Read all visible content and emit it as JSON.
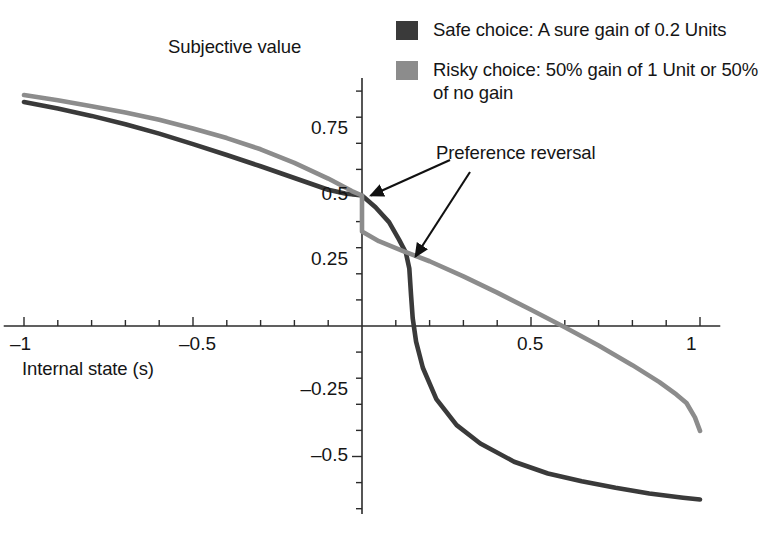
{
  "chart_data": {
    "type": "line",
    "title": "",
    "xlabel": "Internal state (s)",
    "ylabel": "Subjective value",
    "xlim": [
      -1.06,
      1.06
    ],
    "ylim": [
      -0.72,
      0.95
    ],
    "grid": false,
    "legend_position": "top-right",
    "xticks": [
      -1,
      -0.5,
      0.5,
      1
    ],
    "xtick_labels": [
      "–1",
      "–0.5",
      "0.5",
      "1"
    ],
    "yticks": [
      0.75,
      0.5,
      0.25,
      -0.25,
      -0.5
    ],
    "ytick_labels": [
      "0.75",
      "0.5",
      "0.25",
      "–0.25",
      "–0.5"
    ],
    "minor_tick_step": 0.1,
    "annotations": [
      {
        "text": "Preference reversal",
        "targets": [
          {
            "x": 0.0,
            "y": 0.5
          },
          {
            "x": 0.135,
            "y": 0.275
          }
        ]
      }
    ],
    "series": [
      {
        "name": "Safe choice: A sure gain of 0.2 Units",
        "color": "#3a3a3a",
        "x": [
          -1.0,
          -0.9,
          -0.8,
          -0.7,
          -0.6,
          -0.5,
          -0.4,
          -0.3,
          -0.2,
          -0.1,
          -0.05,
          0.0,
          0.04,
          0.08,
          0.11,
          0.13,
          0.14,
          0.145,
          0.15,
          0.16,
          0.18,
          0.22,
          0.28,
          0.35,
          0.45,
          0.55,
          0.65,
          0.75,
          0.85,
          0.95,
          1.0
        ],
        "y": [
          0.858,
          0.833,
          0.805,
          0.773,
          0.737,
          0.697,
          0.655,
          0.612,
          0.567,
          0.522,
          0.508,
          0.5,
          0.455,
          0.398,
          0.33,
          0.28,
          0.22,
          0.12,
          0.03,
          -0.06,
          -0.16,
          -0.28,
          -0.38,
          -0.45,
          -0.52,
          -0.565,
          -0.595,
          -0.62,
          -0.642,
          -0.658,
          -0.665
        ]
      },
      {
        "name": "Risky choice: 50% gain of 1 Unit or 50% of no gain",
        "color": "#8c8c8c",
        "x": [
          -1.0,
          -0.9,
          -0.8,
          -0.7,
          -0.6,
          -0.5,
          -0.4,
          -0.3,
          -0.2,
          -0.1,
          -0.03,
          0.0,
          0.0,
          0.05,
          0.12,
          0.2,
          0.3,
          0.4,
          0.5,
          0.6,
          0.7,
          0.8,
          0.88,
          0.93,
          0.96,
          0.985,
          1.0
        ],
        "y": [
          0.885,
          0.865,
          0.842,
          0.818,
          0.79,
          0.757,
          0.72,
          0.677,
          0.625,
          0.565,
          0.517,
          0.5,
          0.362,
          0.325,
          0.288,
          0.248,
          0.19,
          0.128,
          0.062,
          -0.005,
          -0.075,
          -0.15,
          -0.215,
          -0.262,
          -0.295,
          -0.35,
          -0.402
        ]
      }
    ]
  },
  "legend": {
    "items": [
      {
        "label": "Safe choice: A sure gain of 0.2 Units",
        "color": "#3a3a3a"
      },
      {
        "label": "Risky choice: 50% gain of 1 Unit or 50% of no gain",
        "color": "#8c8c8c"
      }
    ]
  },
  "labels": {
    "y_axis_title": "Subjective value",
    "x_axis_title": "Internal state (s)",
    "annotation": "Preference reversal"
  }
}
